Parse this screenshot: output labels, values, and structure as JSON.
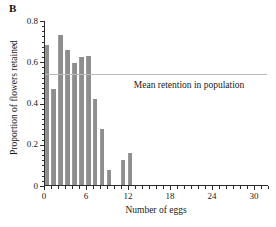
{
  "panel": {
    "label": "B"
  },
  "chart_data": {
    "type": "bar",
    "title": "",
    "xlabel": "Number of eggs",
    "ylabel": "Proportion of flowers retained",
    "xlim": [
      0,
      32
    ],
    "ylim": [
      0,
      0.8
    ],
    "grid": false,
    "legend_position": "none",
    "x_ticks_major": [
      0,
      6,
      12,
      18,
      24,
      30
    ],
    "x_tick_labels": [
      "0",
      "6",
      "12",
      "18",
      "24",
      "30"
    ],
    "x_tick_minor_step": 1,
    "y_ticks_major": [
      0,
      0.2,
      0.4,
      0.6,
      0.8
    ],
    "y_tick_labels": [
      "0",
      "0.2",
      "0.4",
      "0.6",
      "0.8"
    ],
    "y_tick_minor_step": 0.025,
    "bar_color": "#8e8e8e",
    "categories": [
      0,
      1,
      2,
      3,
      4,
      5,
      6,
      7,
      8,
      9,
      10,
      11,
      12
    ],
    "values": [
      0.685,
      0.47,
      0.735,
      0.665,
      0.6,
      0.63,
      0.635,
      0.42,
      0.275,
      0.075,
      0,
      0.125,
      0.155
    ],
    "annotations": [
      {
        "name": "mean-retention-line",
        "text": "Mean retention in population",
        "value": 0.54,
        "line_color": "#b9b9b9",
        "text_x": 12.8,
        "text_y": 0.46
      }
    ]
  }
}
